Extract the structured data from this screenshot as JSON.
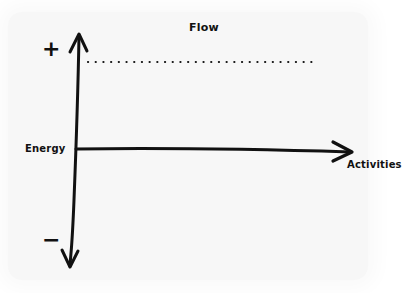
{
  "diagram": {
    "title": "Flow",
    "y_axis": {
      "label": "Energy",
      "positive_marker": "+",
      "negative_marker": "−",
      "direction": "bidirectional-vertical"
    },
    "x_axis": {
      "label": "Activities",
      "direction": "right"
    },
    "reference_line": {
      "style": "dotted",
      "position": "upper energy level"
    },
    "colors": {
      "ink": "#111111",
      "paper": "#f7f7f7",
      "background": "#ffffff"
    }
  }
}
